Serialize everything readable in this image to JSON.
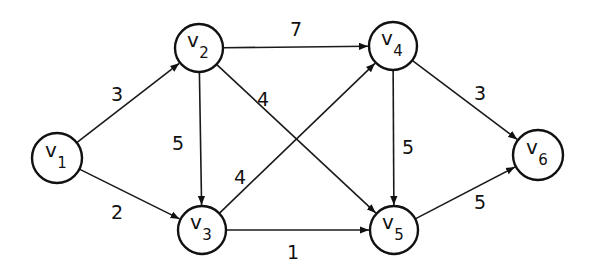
{
  "graph": {
    "type": "directed-weighted",
    "nodes": [
      {
        "id": "v1",
        "label": "v",
        "sub": "1",
        "x": 57,
        "y": 158,
        "r": 25
      },
      {
        "id": "v2",
        "label": "v",
        "sub": "2",
        "x": 199,
        "y": 48,
        "r": 24
      },
      {
        "id": "v3",
        "label": "v",
        "sub": "3",
        "x": 202,
        "y": 230,
        "r": 24
      },
      {
        "id": "v4",
        "label": "v",
        "sub": "4",
        "x": 393,
        "y": 46,
        "r": 24
      },
      {
        "id": "v5",
        "label": "v",
        "sub": "5",
        "x": 394,
        "y": 230,
        "r": 24
      },
      {
        "id": "v6",
        "label": "v",
        "sub": "6",
        "x": 538,
        "y": 155,
        "r": 25
      }
    ],
    "edges": [
      {
        "from": "v1",
        "to": "v2",
        "weight": "3",
        "lx": 117,
        "ly": 95
      },
      {
        "from": "v1",
        "to": "v3",
        "weight": "2",
        "lx": 117,
        "ly": 213
      },
      {
        "from": "v2",
        "to": "v4",
        "weight": "7",
        "lx": 296,
        "ly": 30
      },
      {
        "from": "v2",
        "to": "v3",
        "weight": "5",
        "lx": 178,
        "ly": 144
      },
      {
        "from": "v2",
        "to": "v5",
        "weight": "4",
        "lx": 263,
        "ly": 100
      },
      {
        "from": "v3",
        "to": "v4",
        "weight": "4",
        "lx": 240,
        "ly": 178
      },
      {
        "from": "v3",
        "to": "v5",
        "weight": "1",
        "lx": 293,
        "ly": 253
      },
      {
        "from": "v4",
        "to": "v5",
        "weight": "5",
        "lx": 408,
        "ly": 148
      },
      {
        "from": "v4",
        "to": "v6",
        "weight": "3",
        "lx": 480,
        "ly": 94
      },
      {
        "from": "v5",
        "to": "v6",
        "weight": "5",
        "lx": 480,
        "ly": 203
      }
    ]
  }
}
